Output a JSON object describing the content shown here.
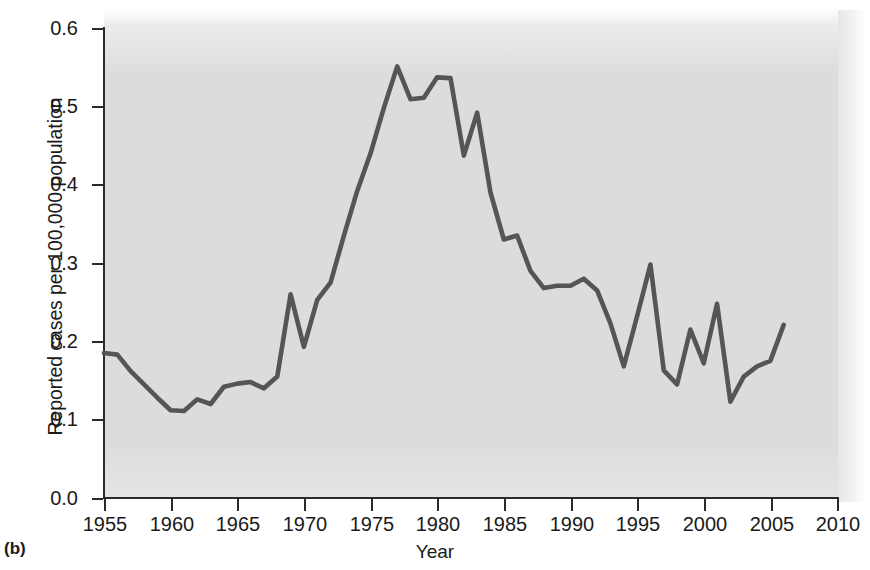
{
  "panel_label": "(b)",
  "chart_data": {
    "type": "line",
    "title": "",
    "xlabel": "Year",
    "ylabel": "Reported cases per 100,000 population",
    "xlim": [
      1955,
      2010
    ],
    "ylim": [
      0.0,
      0.6
    ],
    "grid": false,
    "legend": "none",
    "line_color": "#555555",
    "plot_background": "#dcdcdc",
    "page_background": "#ffffff",
    "axis_color": "#2b2b2b",
    "xticks": [
      1955,
      1960,
      1965,
      1970,
      1975,
      1980,
      1985,
      1990,
      1995,
      2000,
      2005,
      2010
    ],
    "xtick_labels": [
      "1955",
      "1960",
      "1965",
      "1970",
      "1975",
      "1980",
      "1985",
      "1990",
      "1995",
      "2000",
      "2005",
      "2010"
    ],
    "yticks": [
      0.0,
      0.1,
      0.2,
      0.3,
      0.4,
      0.5,
      0.6
    ],
    "ytick_labels": [
      "0.0",
      "0.1",
      "0.2",
      "0.3",
      "0.4",
      "0.5",
      "0.6"
    ],
    "x": [
      1955,
      1956,
      1957,
      1958,
      1959,
      1960,
      1961,
      1962,
      1963,
      1964,
      1965,
      1966,
      1967,
      1968,
      1969,
      1970,
      1971,
      1972,
      1973,
      1974,
      1975,
      1976,
      1977,
      1978,
      1979,
      1980,
      1981,
      1982,
      1983,
      1984,
      1985,
      1986,
      1987,
      1988,
      1989,
      1990,
      1991,
      1992,
      1993,
      1994,
      1995,
      1996,
      1997,
      1998,
      1999,
      2000,
      2001,
      2002,
      2003,
      2004,
      2005,
      2006
    ],
    "y": [
      0.185,
      0.183,
      0.162,
      0.145,
      0.128,
      0.112,
      0.111,
      0.126,
      0.12,
      0.142,
      0.146,
      0.148,
      0.14,
      0.155,
      0.26,
      0.193,
      0.253,
      0.275,
      0.335,
      0.392,
      0.44,
      0.498,
      0.551,
      0.509,
      0.511,
      0.537,
      0.536,
      0.437,
      0.492,
      0.39,
      0.33,
      0.335,
      0.29,
      0.268,
      0.271,
      0.271,
      0.28,
      0.265,
      0.223,
      0.168,
      0.232,
      0.298,
      0.163,
      0.145,
      0.215,
      0.172,
      0.248,
      0.123,
      0.155,
      0.168,
      0.175,
      0.221
    ]
  }
}
